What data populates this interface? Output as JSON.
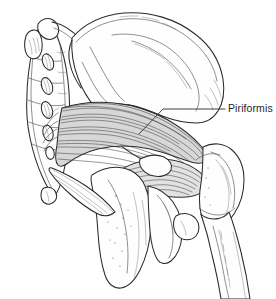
{
  "illustration": {
    "title": "Piriformis muscle anatomical line drawing",
    "type": "medical-line-drawing",
    "view": "posterior view of right hemipelvis and proximal femur",
    "background_color": "#ffffff",
    "ink_color": "#2b2b2b",
    "muscle_shade_color": "#d7d7d7"
  },
  "labels": [
    {
      "id": "piriformis",
      "text": "Piriformis",
      "color": "#1f1f1f",
      "x": 228,
      "y": 102,
      "leader_line": {
        "from_x": 225,
        "from_y": 109,
        "elbow_x": 163,
        "elbow_y": 109,
        "to_x": 139,
        "to_y": 134
      }
    }
  ],
  "structures": [
    {
      "name": "sacrum",
      "kind": "bone"
    },
    {
      "name": "sacral-foramina",
      "kind": "bone-feature"
    },
    {
      "name": "coccyx",
      "kind": "bone"
    },
    {
      "name": "ilium",
      "kind": "bone"
    },
    {
      "name": "iliac-crest",
      "kind": "bone-feature"
    },
    {
      "name": "greater-sciatic-notch",
      "kind": "bone-feature"
    },
    {
      "name": "ischium",
      "kind": "bone"
    },
    {
      "name": "ischial-tuberosity",
      "kind": "bone-feature"
    },
    {
      "name": "ischial-spine",
      "kind": "bone-feature"
    },
    {
      "name": "sacrotuberous-ligament",
      "kind": "ligament"
    },
    {
      "name": "piriformis-muscle",
      "kind": "muscle"
    },
    {
      "name": "gemellus-obturator-group",
      "kind": "muscle"
    },
    {
      "name": "femoral-head",
      "kind": "bone"
    },
    {
      "name": "greater-trochanter",
      "kind": "bone-feature"
    },
    {
      "name": "femur-shaft",
      "kind": "bone"
    },
    {
      "name": "lesser-trochanter",
      "kind": "bone-feature"
    }
  ]
}
